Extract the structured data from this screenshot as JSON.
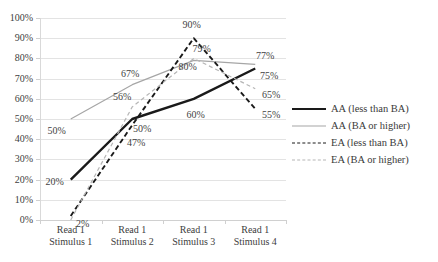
{
  "chart_data": {
    "type": "line",
    "title": "",
    "xlabel": "",
    "ylabel": "",
    "ylim": [
      0,
      100
    ],
    "grid": true,
    "legend_position": "right",
    "categories": [
      "Read 1 Stimulus 1",
      "Read 1 Stimulus 2",
      "Read 1 Stimulus 3",
      "Read 1 Stimulus 4"
    ],
    "category_lines": [
      [
        "Read 1",
        "Stimulus 1"
      ],
      [
        "Read 1",
        "Stimulus 2"
      ],
      [
        "Read 1",
        "Stimulus 3"
      ],
      [
        "Read 1",
        "Stimulus 4"
      ]
    ],
    "ytick_labels": [
      "100%",
      "90%",
      "80%",
      "70%",
      "60%",
      "50%",
      "40%",
      "30%",
      "20%",
      "10%",
      "0%"
    ],
    "ytick_values": [
      100,
      90,
      80,
      70,
      60,
      50,
      40,
      30,
      20,
      10,
      0
    ],
    "series": [
      {
        "name": "AA (less than BA)",
        "style": "solid",
        "color": "#1a1a1a",
        "width": 2.4,
        "values": [
          20,
          50,
          60,
          75
        ],
        "labels": [
          "20%",
          "50%",
          "60%",
          "75%"
        ]
      },
      {
        "name": "AA (BA or higher)",
        "style": "solid",
        "color": "#a6a6a6",
        "width": 1.2,
        "values": [
          50,
          67,
          79,
          77
        ],
        "labels": [
          "50%",
          "67%",
          "79%",
          "77%"
        ]
      },
      {
        "name": "EA (less than BA)",
        "style": "dashed",
        "color": "#1a1a1a",
        "width": 1.9,
        "values": [
          2,
          47,
          90,
          55
        ],
        "labels": [
          "2%",
          "47%",
          "90%",
          "55%"
        ]
      },
      {
        "name": "EA (BA or higher)",
        "style": "dashed",
        "color": "#b5b5b5",
        "width": 1.2,
        "values": [
          0,
          56,
          80,
          65
        ],
        "labels": [
          "",
          "56%",
          "80%",
          "65%"
        ]
      }
    ]
  },
  "legend": {
    "items": [
      {
        "label": "AA (less than BA)"
      },
      {
        "label": "AA (BA or higher)"
      },
      {
        "label": "EA (less than BA)"
      },
      {
        "label": "EA (BA or higher)"
      }
    ]
  }
}
